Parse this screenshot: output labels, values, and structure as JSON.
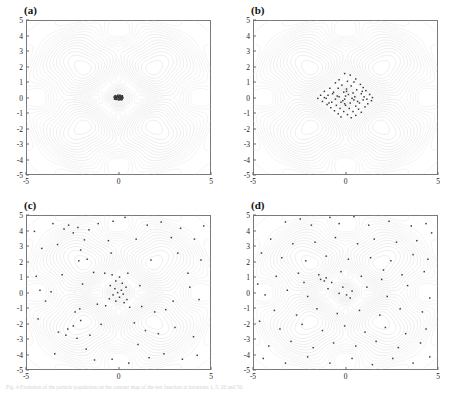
{
  "figure": {
    "caption": "Fig. 4 Evolution of the particle population on the contour map of the test function at iterations 1, 5, 20 and 50."
  },
  "axis": {
    "xticks": [
      "-5",
      "0",
      "5"
    ],
    "xtickvals": [
      -5,
      0,
      5
    ],
    "yticks": [
      "5",
      "4",
      "3",
      "2",
      "1",
      "0",
      "-1",
      "-2",
      "-3",
      "-4",
      "-5"
    ],
    "ytickvals": [
      5,
      4,
      3,
      2,
      1,
      0,
      -1,
      -2,
      -3,
      -4,
      -5
    ],
    "xlim": [
      -5,
      5
    ],
    "ylim": [
      -5,
      5
    ],
    "xlabel": "",
    "ylabel": ""
  },
  "style": {
    "contour_color": "#c9c9c9",
    "contour_color_strong": "#b0b0b0",
    "frame_color": "#7a7a7a",
    "point_color": "#3a3a3a",
    "background": "#ffffff"
  },
  "panels": [
    {
      "id": "a",
      "label": "(a)"
    },
    {
      "id": "b",
      "label": "(b)"
    },
    {
      "id": "c",
      "label": "(c)"
    },
    {
      "id": "d",
      "label": "(d)"
    }
  ],
  "chart_data": [
    {
      "type": "scatter",
      "title": "(a)",
      "xlabel": "",
      "ylabel": "",
      "xlim": [
        -5,
        5
      ],
      "ylim": [
        -5,
        5
      ],
      "grid": false,
      "legend": "none",
      "background": "contour map of four-peak test function with peaks near (-2,2), (2,2), (-2,-2), (2,-2) and a sharp central ridge at (0,0)",
      "annotation": "all particles collapsed into a tight cluster at the origin",
      "points": [
        [
          -0.18,
          0.08
        ],
        [
          -0.12,
          0.02
        ],
        [
          -0.06,
          0.12
        ],
        [
          0.0,
          0.05
        ],
        [
          0.06,
          0.1
        ],
        [
          0.12,
          0.02
        ],
        [
          0.18,
          -0.04
        ],
        [
          -0.2,
          -0.06
        ],
        [
          -0.14,
          -0.12
        ],
        [
          -0.08,
          -0.02
        ],
        [
          -0.02,
          -0.1
        ],
        [
          0.04,
          -0.06
        ],
        [
          0.1,
          -0.12
        ],
        [
          0.16,
          0.06
        ],
        [
          0.22,
          0.0
        ],
        [
          -0.24,
          0.04
        ],
        [
          -0.04,
          0.16
        ],
        [
          0.02,
          -0.16
        ],
        [
          0.08,
          0.16
        ],
        [
          0.14,
          -0.14
        ],
        [
          -0.1,
          0.08
        ],
        [
          -0.16,
          -0.02
        ],
        [
          0.2,
          0.12
        ],
        [
          -0.22,
          -0.1
        ],
        [
          0.0,
          0.0
        ],
        [
          0.05,
          -0.02
        ],
        [
          -0.05,
          0.03
        ],
        [
          0.11,
          0.07
        ],
        [
          -0.11,
          -0.07
        ],
        [
          0.17,
          -0.09
        ],
        [
          -0.17,
          0.09
        ],
        [
          0.23,
          -0.03
        ],
        [
          -0.23,
          0.01
        ],
        [
          0.03,
          0.13
        ],
        [
          -0.03,
          -0.13
        ],
        [
          0.09,
          -0.05
        ],
        [
          -0.09,
          0.05
        ],
        [
          0.15,
          0.01
        ],
        [
          -0.15,
          -0.01
        ],
        [
          0.21,
          0.08
        ],
        [
          -0.21,
          -0.08
        ],
        [
          0.07,
          -0.1
        ],
        [
          -0.07,
          0.1
        ],
        [
          0.13,
          0.11
        ],
        [
          -0.13,
          -0.11
        ],
        [
          0.19,
          -0.13
        ],
        [
          -0.19,
          0.13
        ],
        [
          0.01,
          0.07
        ]
      ]
    },
    {
      "type": "scatter",
      "title": "(b)",
      "xlabel": "",
      "ylabel": "",
      "xlim": [
        -5,
        5
      ],
      "ylim": [
        -5,
        5
      ],
      "grid": false,
      "legend": "none",
      "background": "contour map of four-peak test function with peaks near (-2,2), (2,2), (-2,-2), (2,-2) and a sharp central ridge at (0,0)",
      "annotation": "particles concentrated in the central diamond region, spread about -1.5 to 1.5",
      "points": [
        [
          -0.05,
          1.55
        ],
        [
          0.25,
          1.45
        ],
        [
          0.55,
          1.2
        ],
        [
          -0.35,
          1.15
        ],
        [
          0.1,
          1.05
        ],
        [
          0.45,
          1.0
        ],
        [
          -0.55,
          0.95
        ],
        [
          0.8,
          0.85
        ],
        [
          -0.2,
          0.8
        ],
        [
          0.3,
          0.75
        ],
        [
          0.95,
          0.65
        ],
        [
          -0.85,
          0.6
        ],
        [
          -0.4,
          0.6
        ],
        [
          0.05,
          0.55
        ],
        [
          0.6,
          0.5
        ],
        [
          1.1,
          0.45
        ],
        [
          -1.15,
          0.4
        ],
        [
          -0.65,
          0.35
        ],
        [
          -0.1,
          0.35
        ],
        [
          0.4,
          0.3
        ],
        [
          0.85,
          0.25
        ],
        [
          1.3,
          0.2
        ],
        [
          -1.35,
          0.15
        ],
        [
          -0.95,
          0.15
        ],
        [
          -0.45,
          0.1
        ],
        [
          0.0,
          0.1
        ],
        [
          0.5,
          0.05
        ],
        [
          1.0,
          0.05
        ],
        [
          1.45,
          0.0
        ],
        [
          -1.5,
          -0.05
        ],
        [
          -1.05,
          -0.05
        ],
        [
          -0.55,
          -0.1
        ],
        [
          -0.05,
          -0.1
        ],
        [
          0.45,
          -0.15
        ],
        [
          0.95,
          -0.15
        ],
        [
          1.4,
          -0.2
        ],
        [
          -1.25,
          -0.25
        ],
        [
          -0.75,
          -0.3
        ],
        [
          -0.25,
          -0.3
        ],
        [
          0.25,
          -0.35
        ],
        [
          0.75,
          -0.35
        ],
        [
          1.2,
          -0.4
        ],
        [
          -1.0,
          -0.45
        ],
        [
          -0.5,
          -0.5
        ],
        [
          0.0,
          -0.5
        ],
        [
          0.55,
          -0.55
        ],
        [
          1.05,
          -0.6
        ],
        [
          -0.8,
          -0.65
        ],
        [
          -0.3,
          -0.7
        ],
        [
          0.2,
          -0.7
        ],
        [
          0.7,
          -0.75
        ],
        [
          -0.6,
          -0.85
        ],
        [
          -0.1,
          -0.9
        ],
        [
          0.4,
          -0.9
        ],
        [
          0.85,
          -0.95
        ],
        [
          -0.4,
          -1.05
        ],
        [
          0.1,
          -1.1
        ],
        [
          0.55,
          -1.15
        ],
        [
          -0.25,
          -1.25
        ],
        [
          0.3,
          -1.3
        ],
        [
          0.15,
          0.2
        ],
        [
          -0.15,
          -0.2
        ],
        [
          0.35,
          -0.05
        ],
        [
          -0.35,
          0.05
        ],
        [
          0.65,
          -0.25
        ],
        [
          -0.7,
          0.25
        ],
        [
          0.05,
          0.4
        ],
        [
          -0.05,
          -0.4
        ],
        [
          1.15,
          -0.1
        ],
        [
          -1.15,
          0.0
        ],
        [
          0.9,
          0.4
        ],
        [
          -0.9,
          -0.35
        ]
      ]
    },
    {
      "type": "scatter",
      "title": "(c)",
      "xlabel": "",
      "ylabel": "",
      "xlim": [
        -5,
        5
      ],
      "ylim": [
        -5,
        5
      ],
      "grid": false,
      "legend": "none",
      "background": "contour map of four-peak test function with peaks near (-2,2), (2,2), (-2,-2), (2,-2) and a sharp central ridge at (0,0)",
      "annotation": "particles widely scattered over the whole domain with a dense core at the origin",
      "points": [
        [
          -3.55,
          4.45
        ],
        [
          -2.95,
          4.1
        ],
        [
          -2.7,
          4.35
        ],
        [
          -2.45,
          3.85
        ],
        [
          -2.2,
          4.2
        ],
        [
          -1.6,
          4.05
        ],
        [
          -1.1,
          4.45
        ],
        [
          -0.3,
          4.6
        ],
        [
          0.35,
          4.85
        ],
        [
          1.55,
          4.35
        ],
        [
          2.3,
          4.55
        ],
        [
          3.35,
          4.15
        ],
        [
          4.6,
          4.3
        ],
        [
          4.1,
          3.45
        ],
        [
          2.85,
          3.55
        ],
        [
          0.95,
          3.45
        ],
        [
          -0.55,
          3.35
        ],
        [
          -1.85,
          3.4
        ],
        [
          -3.3,
          3.1
        ],
        [
          -4.15,
          2.85
        ],
        [
          -2.05,
          2.75
        ],
        [
          -1.7,
          2.15
        ],
        [
          -2.15,
          2.05
        ],
        [
          -0.4,
          2.55
        ],
        [
          1.75,
          2.1
        ],
        [
          3.2,
          2.55
        ],
        [
          4.45,
          2.1
        ],
        [
          -4.45,
          1.05
        ],
        [
          -3.05,
          1.15
        ],
        [
          -1.35,
          1.3
        ],
        [
          -0.75,
          1.25
        ],
        [
          -0.35,
          1.15
        ],
        [
          0.05,
          1.0
        ],
        [
          0.5,
          1.25
        ],
        [
          -0.15,
          0.75
        ],
        [
          0.2,
          0.6
        ],
        [
          -0.45,
          0.45
        ],
        [
          0.4,
          0.35
        ],
        [
          -0.2,
          0.25
        ],
        [
          0.15,
          0.15
        ],
        [
          -0.05,
          0.0
        ],
        [
          0.25,
          -0.1
        ],
        [
          -0.3,
          -0.15
        ],
        [
          0.05,
          -0.3
        ],
        [
          -0.5,
          -0.4
        ],
        [
          0.45,
          -0.45
        ],
        [
          -0.15,
          -0.55
        ],
        [
          0.3,
          -0.65
        ],
        [
          -0.7,
          -0.85
        ],
        [
          0.6,
          -0.95
        ],
        [
          -1.15,
          -0.75
        ],
        [
          1.25,
          -0.9
        ],
        [
          -2.1,
          -1.05
        ],
        [
          1.95,
          -1.25
        ],
        [
          2.55,
          -1.1
        ],
        [
          -3.95,
          -0.55
        ],
        [
          -4.25,
          0.15
        ],
        [
          -4.35,
          -1.7
        ],
        [
          -3.25,
          -2.55
        ],
        [
          -2.75,
          -2.35
        ],
        [
          -2.35,
          -1.25
        ],
        [
          -2.05,
          -1.8
        ],
        [
          -2.45,
          -2.15
        ],
        [
          -2.85,
          -2.75
        ],
        [
          -2.25,
          -2.95
        ],
        [
          -1.75,
          -3.65
        ],
        [
          -3.45,
          -3.95
        ],
        [
          -1.3,
          -4.35
        ],
        [
          -0.35,
          -4.3
        ],
        [
          0.55,
          -4.55
        ],
        [
          1.65,
          -4.2
        ],
        [
          2.45,
          -3.95
        ],
        [
          3.45,
          -4.3
        ],
        [
          4.25,
          -4.05
        ],
        [
          1.05,
          -3.35
        ],
        [
          2.15,
          -2.65
        ],
        [
          3.05,
          -2.25
        ],
        [
          4.05,
          -2.85
        ],
        [
          0.85,
          -1.95
        ],
        [
          1.45,
          -2.45
        ],
        [
          -0.95,
          -2.05
        ],
        [
          -1.55,
          -2.75
        ],
        [
          3.85,
          0.35
        ],
        [
          4.35,
          -0.45
        ],
        [
          -4.55,
          3.95
        ],
        [
          3.75,
          1.25
        ],
        [
          -3.65,
          0.05
        ],
        [
          2.95,
          -0.55
        ],
        [
          -1.95,
          0.55
        ],
        [
          1.15,
          0.45
        ]
      ]
    },
    {
      "type": "scatter",
      "title": "(d)",
      "xlabel": "",
      "ylabel": "",
      "xlim": [
        -5,
        5
      ],
      "ylim": [
        -5,
        5
      ],
      "grid": false,
      "legend": "none",
      "background": "contour map of four-peak test function with peaks near (-2,2), (2,2), (-2,-2), (2,-2) and a sharp central ridge at (0,0)",
      "annotation": "initial random population spread uniformly across the search space",
      "points": [
        [
          -3.25,
          4.55
        ],
        [
          -2.45,
          4.75
        ],
        [
          -1.85,
          4.35
        ],
        [
          -0.85,
          4.85
        ],
        [
          -0.35,
          4.45
        ],
        [
          0.45,
          4.9
        ],
        [
          1.25,
          4.35
        ],
        [
          2.35,
          4.6
        ],
        [
          3.55,
          4.3
        ],
        [
          4.35,
          4.45
        ],
        [
          4.65,
          3.85
        ],
        [
          3.85,
          3.35
        ],
        [
          2.75,
          3.25
        ],
        [
          1.55,
          3.45
        ],
        [
          0.65,
          3.15
        ],
        [
          -0.55,
          3.55
        ],
        [
          -1.65,
          3.25
        ],
        [
          -2.85,
          3.15
        ],
        [
          -4.05,
          3.45
        ],
        [
          -4.55,
          2.55
        ],
        [
          -3.45,
          2.25
        ],
        [
          -2.15,
          2.05
        ],
        [
          -1.05,
          2.35
        ],
        [
          0.15,
          2.15
        ],
        [
          1.35,
          2.25
        ],
        [
          2.45,
          2.05
        ],
        [
          3.65,
          2.45
        ],
        [
          4.45,
          2.15
        ],
        [
          4.25,
          1.35
        ],
        [
          3.05,
          1.15
        ],
        [
          2.05,
          1.45
        ],
        [
          0.85,
          1.05
        ],
        [
          -0.25,
          1.35
        ],
        [
          -1.45,
          1.15
        ],
        [
          -2.55,
          1.25
        ],
        [
          -3.75,
          1.05
        ],
        [
          -4.75,
          0.55
        ],
        [
          -4.35,
          -0.15
        ],
        [
          -3.15,
          0.15
        ],
        [
          -2.05,
          -0.25
        ],
        [
          -0.95,
          0.25
        ],
        [
          0.05,
          -0.15
        ],
        [
          0.35,
          0.1
        ],
        [
          -0.15,
          0.35
        ],
        [
          0.25,
          -0.35
        ],
        [
          -0.35,
          -0.05
        ],
        [
          1.15,
          0.35
        ],
        [
          2.25,
          -0.25
        ],
        [
          3.35,
          0.45
        ],
        [
          4.55,
          -0.35
        ],
        [
          4.15,
          -1.25
        ],
        [
          2.95,
          -1.05
        ],
        [
          1.85,
          -1.45
        ],
        [
          0.75,
          -1.15
        ],
        [
          -0.45,
          -1.35
        ],
        [
          -1.55,
          -1.05
        ],
        [
          -2.65,
          -1.45
        ],
        [
          -3.85,
          -1.15
        ],
        [
          -4.65,
          -1.85
        ],
        [
          -3.55,
          -2.35
        ],
        [
          -2.35,
          -2.05
        ],
        [
          -1.25,
          -2.45
        ],
        [
          -0.05,
          -2.15
        ],
        [
          1.05,
          -2.55
        ],
        [
          2.15,
          -2.25
        ],
        [
          3.25,
          -2.65
        ],
        [
          4.35,
          -2.35
        ],
        [
          4.05,
          -3.25
        ],
        [
          2.85,
          -3.55
        ],
        [
          1.65,
          -3.15
        ],
        [
          0.55,
          -3.45
        ],
        [
          -0.65,
          -3.25
        ],
        [
          -1.75,
          -3.55
        ],
        [
          -2.95,
          -3.15
        ],
        [
          -4.15,
          -3.45
        ],
        [
          -4.45,
          -4.25
        ],
        [
          -3.25,
          -4.55
        ],
        [
          -2.05,
          -4.15
        ],
        [
          -0.85,
          -4.55
        ],
        [
          0.35,
          -4.25
        ],
        [
          1.45,
          -4.65
        ],
        [
          2.55,
          -4.25
        ],
        [
          3.65,
          -4.55
        ],
        [
          4.55,
          -4.15
        ],
        [
          -1.35,
          0.85
        ],
        [
          -1.15,
          0.75
        ],
        [
          -1.05,
          0.95
        ],
        [
          -0.75,
          0.65
        ],
        [
          1.95,
          0.85
        ],
        [
          -2.25,
          0.65
        ]
      ]
    }
  ]
}
